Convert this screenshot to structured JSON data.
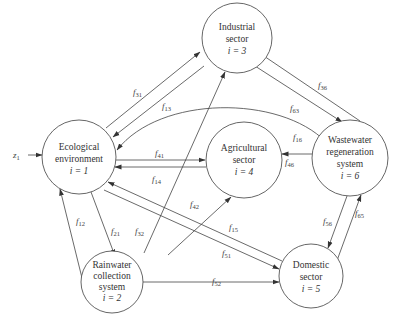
{
  "diagram": {
    "nodes": [
      {
        "id": 1,
        "lines": [
          "Ecological",
          "environment"
        ],
        "index": "i = 1",
        "cx": 79,
        "cy": 157,
        "r": 37
      },
      {
        "id": 2,
        "lines": [
          "Rainwater",
          "collection",
          "system"
        ],
        "index": "i = 2",
        "cx": 112,
        "cy": 282,
        "r": 31
      },
      {
        "id": 3,
        "lines": [
          "Industrial",
          "sector"
        ],
        "index": "i = 3",
        "cx": 237,
        "cy": 38,
        "r": 35
      },
      {
        "id": 4,
        "lines": [
          "Agricultural",
          "sector"
        ],
        "index": "i = 4",
        "cx": 244,
        "cy": 160,
        "r": 38
      },
      {
        "id": 5,
        "lines": [
          "Domestic",
          "sector"
        ],
        "index": "i = 5",
        "cx": 311,
        "cy": 276,
        "r": 32
      },
      {
        "id": 6,
        "lines": [
          "Wastewater",
          "regeneration",
          "system"
        ],
        "index": "i = 6",
        "cx": 350,
        "cy": 158,
        "r": 38
      }
    ],
    "input": {
      "label": "z",
      "sub": "1",
      "target": 1
    },
    "edges": [
      {
        "name": "f",
        "sub": "31",
        "from": 1,
        "to": 3
      },
      {
        "name": "f",
        "sub": "13",
        "from": 3,
        "to": 1
      },
      {
        "name": "f",
        "sub": "36",
        "from": 6,
        "to": 3
      },
      {
        "name": "f",
        "sub": "63",
        "from": 3,
        "to": 6
      },
      {
        "name": "f",
        "sub": "16",
        "from": 6,
        "to": 1
      },
      {
        "name": "f",
        "sub": "41",
        "from": 1,
        "to": 4
      },
      {
        "name": "f",
        "sub": "14",
        "from": 4,
        "to": 1
      },
      {
        "name": "f",
        "sub": "46",
        "from": 6,
        "to": 4
      },
      {
        "name": "f",
        "sub": "12",
        "from": 2,
        "to": 1
      },
      {
        "name": "f",
        "sub": "21",
        "from": 1,
        "to": 2
      },
      {
        "name": "f",
        "sub": "32",
        "from": 2,
        "to": 3
      },
      {
        "name": "f",
        "sub": "42",
        "from": 2,
        "to": 4
      },
      {
        "name": "f",
        "sub": "15",
        "from": 5,
        "to": 1
      },
      {
        "name": "f",
        "sub": "51",
        "from": 1,
        "to": 5
      },
      {
        "name": "f",
        "sub": "52",
        "from": 2,
        "to": 5
      },
      {
        "name": "f",
        "sub": "56",
        "from": 6,
        "to": 5
      },
      {
        "name": "f",
        "sub": "65",
        "from": 5,
        "to": 6
      }
    ]
  }
}
